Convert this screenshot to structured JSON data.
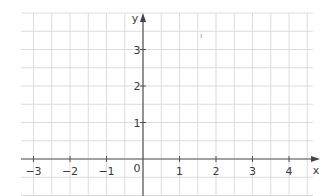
{
  "chart_data": {
    "type": "scatter",
    "title": "",
    "xlabel": "x",
    "ylabel": "y",
    "xlim": [
      -3,
      4
    ],
    "ylim": [
      0,
      3
    ],
    "x_ticks": [
      "-3",
      "-2",
      "-1",
      "1",
      "2",
      "3",
      "4"
    ],
    "y_ticks": [
      "1",
      "2",
      "3"
    ],
    "origin_label": "0",
    "grid": true,
    "grid_step": 0.5,
    "series": [],
    "colors": {
      "grid": "#d6d6d6",
      "axis": "#555555",
      "text": "#3a3a3a"
    }
  },
  "axes": {
    "x_label": "x",
    "y_label": "y",
    "origin": "0",
    "x_tick_labels": [
      "−3",
      "−2",
      "−1",
      "1",
      "2",
      "3",
      "4"
    ],
    "y_tick_labels": [
      "1",
      "2",
      "3"
    ]
  }
}
